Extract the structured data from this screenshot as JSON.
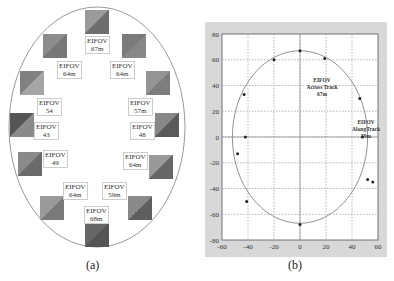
{
  "panel_a": {
    "caption": "(a)",
    "labels": [
      {
        "line1": "EIFOV",
        "line2": "67m",
        "x": 85,
        "y": 36
      },
      {
        "line1": "EIFOV",
        "line2": "64m",
        "x": 57,
        "y": 61
      },
      {
        "line1": "EIFOV",
        "line2": "64m",
        "x": 110,
        "y": 61
      },
      {
        "line1": "EIFOV",
        "line2": "54",
        "x": 37,
        "y": 98
      },
      {
        "line1": "EIFOV",
        "line2": "57m",
        "x": 128,
        "y": 98
      },
      {
        "line1": "EIFOV",
        "line2": "43",
        "x": 34,
        "y": 122
      },
      {
        "line1": "EIFOV",
        "line2": "48",
        "x": 130,
        "y": 122
      },
      {
        "line1": "EIFOV",
        "line2": "49",
        "x": 43,
        "y": 150
      },
      {
        "line1": "EIFOV",
        "line2": "64m",
        "x": 123,
        "y": 152
      },
      {
        "line1": "EIFOV",
        "line2": "64m",
        "x": 63,
        "y": 182
      },
      {
        "line1": "EIFOV",
        "line2": "59m",
        "x": 102,
        "y": 182
      },
      {
        "line1": "EIFOV",
        "line2": "68m",
        "x": 84,
        "y": 206
      }
    ],
    "squares": [
      {
        "x": 85,
        "y": 10,
        "c1": "#9a9a9a",
        "c2": "#6e6e6e"
      },
      {
        "x": 43,
        "y": 34,
        "c1": "#8c8c8c",
        "c2": "#777"
      },
      {
        "x": 122,
        "y": 34,
        "c1": "#7a7a7a",
        "c2": "#888"
      },
      {
        "x": 20,
        "y": 71,
        "c1": "#808080",
        "c2": "#a5a5a5"
      },
      {
        "x": 146,
        "y": 71,
        "c1": "#959595",
        "c2": "#7d7d7d"
      },
      {
        "x": 10,
        "y": 113,
        "c1": "#555",
        "c2": "#8a8a8a"
      },
      {
        "x": 155,
        "y": 113,
        "c1": "#888",
        "c2": "#5a5a5a"
      },
      {
        "x": 18,
        "y": 152,
        "c1": "#8a8a8a",
        "c2": "#6a6a6a"
      },
      {
        "x": 149,
        "y": 155,
        "c1": "#999",
        "c2": "#666"
      },
      {
        "x": 40,
        "y": 196,
        "c1": "#9a9a9a",
        "c2": "#7a7a7a"
      },
      {
        "x": 128,
        "y": 196,
        "c1": "#8a8a8a",
        "c2": "#5e5e5e"
      },
      {
        "x": 85,
        "y": 223,
        "c1": "#666",
        "c2": "#555"
      }
    ]
  },
  "panel_b": {
    "caption": "(b)",
    "annotations": [
      {
        "lines": [
          "EIFOV",
          "Across Track",
          "67m"
        ],
        "x": 0,
        "y": 43
      },
      {
        "lines": [
          "EIFOV",
          "AlongTrack",
          "59m"
        ],
        "x": 37,
        "y": 10
      }
    ]
  },
  "chart_data": [
    {
      "type": "scatter",
      "title": "",
      "xlabel": "",
      "ylabel": "",
      "xlim": [
        -60,
        60
      ],
      "ylim": [
        -80,
        80
      ],
      "xticks": [
        -60,
        -40,
        -20,
        0,
        20,
        40,
        60
      ],
      "yticks": [
        -80,
        -60,
        -40,
        -20,
        0,
        20,
        40,
        60,
        80
      ],
      "grid": true,
      "series": [
        {
          "name": "EIFOV points",
          "x": [
            0,
            -20,
            19,
            -43,
            46,
            -42,
            48,
            -48,
            -41,
            0,
            52,
            56
          ],
          "y": [
            67,
            60,
            61,
            33,
            30,
            0,
            0,
            -13,
            -50,
            -68,
            -33,
            -35
          ]
        },
        {
          "name": "ellipse",
          "semi_x": 52,
          "semi_y": 67
        }
      ],
      "annotations": [
        "EIFOV Across Track 67m",
        "EIFOV AlongTrack 59m"
      ]
    }
  ]
}
